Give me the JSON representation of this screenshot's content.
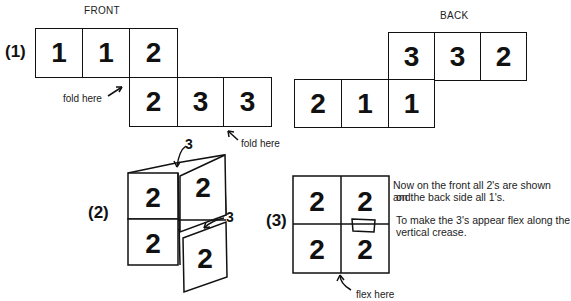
{
  "headers": {
    "front": "FRONT",
    "back": "BACK"
  },
  "step1": {
    "label": "(1)",
    "front_top": [
      "1",
      "1",
      "2"
    ],
    "front_bottom": [
      "2",
      "3",
      "3"
    ],
    "back_top": [
      "3",
      "3",
      "2"
    ],
    "back_bottom": [
      "2",
      "1",
      "1"
    ],
    "fold_left": "fold here",
    "fold_right": "fold here"
  },
  "step2": {
    "label": "(2)",
    "cells": [
      "2",
      "2",
      "2",
      "2"
    ],
    "arrow_label_top": "3",
    "arrow_label_bottom": "3"
  },
  "step3": {
    "label": "(3)",
    "cells": [
      "2",
      "2",
      "2",
      "2"
    ],
    "flex_label": "flex here",
    "text_line1": "Now on the front all 2's are shown and",
    "text_line2": "on the back side all 1's.",
    "text_line3": "To make the 3's appear flex along the",
    "text_line4": "vertical crease."
  }
}
